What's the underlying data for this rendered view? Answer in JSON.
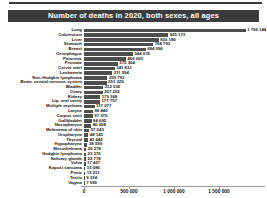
{
  "header": {
    "title": "Number of deaths in 2020, both sexes, all ages"
  },
  "colors": {
    "title_bar_bg": "#3c3c3c",
    "title_text": "#ffffff",
    "bar": "#4e4e4e",
    "axis": "#999999",
    "top_rule": "#3a3a3a"
  },
  "chart_data": {
    "type": "bar",
    "orientation": "horizontal",
    "title": "Number of deaths in 2020, both sexes, all ages",
    "xlabel": "",
    "ylabel": "",
    "grid": false,
    "legend": false,
    "xlim": [
      0,
      1975000
    ],
    "categories": [
      "Lung",
      "Colorectum",
      "Liver",
      "Stomach",
      "Breast",
      "Oesophagus",
      "Pancreas",
      "Prostate",
      "Cervix uteri",
      "Leukaemia",
      "Non-Hodgkin lymphoma",
      "Brain, central nervous system",
      "Bladder",
      "Ovary",
      "Kidney",
      "Lip, oral cavity",
      "Multiple myeloma",
      "Larynx",
      "Corpus uteri",
      "Gallbladder",
      "Nasopharynx",
      "Melanoma of skin",
      "Oropharynx",
      "Thyroid",
      "Hypopharynx",
      "Mesothelioma",
      "Hodgkin lymphoma",
      "Salivary glands",
      "Vulva",
      "Kaposi sarcoma",
      "Penis",
      "Testis",
      "Vagina"
    ],
    "values": [
      1796144,
      935173,
      830180,
      768793,
      684996,
      544076,
      466003,
      375304,
      341831,
      311594,
      259793,
      251329,
      212536,
      207252,
      179368,
      177757,
      117077,
      99840,
      97370,
      84695,
      80008,
      57043,
      48143,
      43646,
      38599,
      26278,
      23376,
      22778,
      17427,
      15086,
      13211,
      9334,
      7995
    ],
    "value_labels": [
      "1 796 144",
      "935 173",
      "830 180",
      "768 793",
      "684 996",
      "544 076",
      "466 003",
      "375 304",
      "341 831",
      "311 594",
      "259 793",
      "251 329",
      "212 536",
      "207 252",
      "179 368",
      "177 757",
      "117 077",
      "99 840",
      "97 370",
      "84 695",
      "80 008",
      "57 043",
      "48 143",
      "43 646",
      "38 599",
      "26 278",
      "23 376",
      "22 778",
      "17 427",
      "15 086",
      "13 211",
      "9 334",
      "7 995"
    ],
    "x_ticks": [
      {
        "value": 0,
        "label": "0"
      },
      {
        "value": 500000,
        "label": "500 000"
      },
      {
        "value": 1000000,
        "label": "1 000 000"
      },
      {
        "value": 1500000,
        "label": "1 500 000"
      }
    ]
  }
}
